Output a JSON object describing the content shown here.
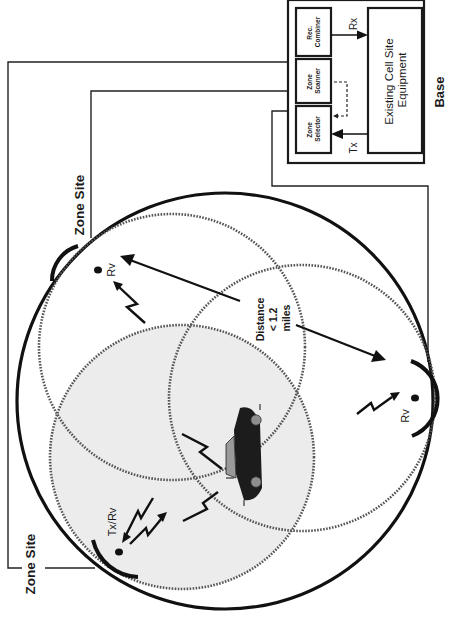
{
  "base": {
    "title": "Base",
    "modules": [
      {
        "label_line1": "Rec.",
        "label_line2": "Combiner"
      },
      {
        "label_line1": "Zone",
        "label_line2": "Scanner"
      },
      {
        "label_line1": "Zone",
        "label_line2": "Selector"
      }
    ],
    "equipment": {
      "line1": "Existing Cell Site",
      "line2": "Equipment"
    },
    "signals": {
      "rx": "Rx",
      "tx": "Tx"
    }
  },
  "zone_sites": [
    {
      "label": "Zone Site",
      "position": "top"
    },
    {
      "label": "Zone Site",
      "position": "bottom"
    }
  ],
  "antennas": [
    {
      "label": "Rv",
      "position": "top"
    },
    {
      "label": "Rv",
      "position": "right"
    },
    {
      "label": "Tx/Rv",
      "position": "bottom-left"
    }
  ],
  "distance_note": {
    "line1": "Distance",
    "line2": "< 1.2",
    "line3": "miles"
  },
  "colors": {
    "ink": "#1a1a1a",
    "shaded_zone": "#ececec",
    "dotted_ring": "#555555",
    "car_body": "#1c1c1c",
    "car_window": "#9a9a9a"
  }
}
